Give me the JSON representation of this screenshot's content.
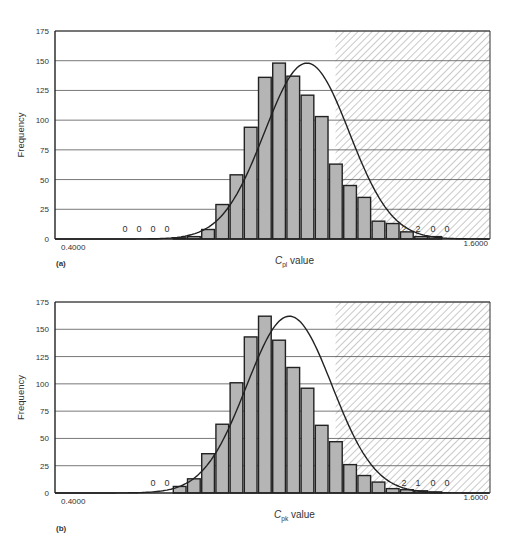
{
  "figure": {
    "panels": [
      {
        "id": "a",
        "label": "(a)"
      },
      {
        "id": "b",
        "label": "(b)"
      }
    ]
  },
  "colors": {
    "bar_fill": "#b5b5b5",
    "bar_stroke": "#222222",
    "grid": "#555555",
    "curve": "#222222",
    "hatch": "#888888"
  },
  "chart_data": [
    {
      "type": "bar",
      "panel": "(a)",
      "title": "",
      "xlabel": "C_pl value",
      "xlabel_main": "C",
      "xlabel_sub": "pl",
      "xlabel_rest": " value",
      "ylabel": "Frequency",
      "ylim": [
        0,
        175
      ],
      "yticks": [
        0,
        25,
        50,
        75,
        100,
        125,
        150,
        175
      ],
      "xtick_labels": {
        "left": "0.4000",
        "right": "1.6000"
      },
      "grid": true,
      "hatched_region": {
        "x_start_fraction": 0.645,
        "meaning": "out-of-spec region"
      },
      "fitted_curve": "normal density overlay",
      "bar_values": [
        1,
        2,
        8,
        29,
        54,
        94,
        136,
        148,
        137,
        121,
        103,
        63,
        45,
        35,
        15,
        13,
        6,
        2,
        2,
        0,
        0
      ],
      "bar_start_fraction": 0.272,
      "bar_pitch_px": 14.2,
      "count_annotations": [
        {
          "text": "0",
          "x": 125,
          "y": 232
        },
        {
          "text": "0",
          "x": 139,
          "y": 232
        },
        {
          "text": "0",
          "x": 153,
          "y": 232
        },
        {
          "text": "0",
          "x": 167,
          "y": 232
        },
        {
          "text": "2",
          "x": 404,
          "y": 232
        },
        {
          "text": "2",
          "x": 418,
          "y": 232
        },
        {
          "text": "0",
          "x": 433,
          "y": 232
        },
        {
          "text": "0",
          "x": 447,
          "y": 232
        }
      ]
    },
    {
      "type": "bar",
      "panel": "(b)",
      "title": "",
      "xlabel": "C_pk value",
      "xlabel_main": "C",
      "xlabel_sub": "pk",
      "xlabel_rest": " value",
      "ylabel": "Frequency",
      "ylim": [
        0,
        175
      ],
      "yticks": [
        0,
        25,
        50,
        75,
        100,
        125,
        150,
        175
      ],
      "xtick_labels": {
        "left": "0.4000",
        "right": "1.6000"
      },
      "grid": true,
      "hatched_region": {
        "x_start_fraction": 0.645,
        "meaning": "out-of-spec region"
      },
      "fitted_curve": "normal density overlay",
      "bar_values": [
        6,
        13,
        36,
        63,
        101,
        143,
        162,
        140,
        115,
        96,
        62,
        47,
        26,
        16,
        10,
        4,
        3,
        2,
        1,
        0,
        0
      ],
      "bar_start_fraction": 0.272,
      "bar_pitch_px": 14.2,
      "count_annotations": [
        {
          "text": "0",
          "x": 153,
          "y": 218
        },
        {
          "text": "0",
          "x": 167,
          "y": 218
        },
        {
          "text": "2",
          "x": 404,
          "y": 218
        },
        {
          "text": "1",
          "x": 418,
          "y": 218
        },
        {
          "text": "0",
          "x": 433,
          "y": 218
        },
        {
          "text": "0",
          "x": 447,
          "y": 218
        }
      ]
    }
  ]
}
